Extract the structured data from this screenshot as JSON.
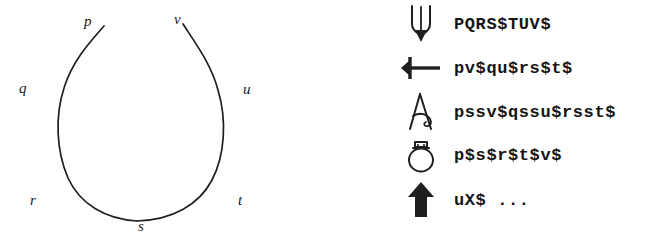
{
  "figure": {
    "caption": "",
    "ink_color": "#1a1a1a",
    "background_color": "#ffffff"
  },
  "loop_diagram": {
    "name": "open-loop-curve",
    "description": "Open teardrop / loop curve with a gap at the top, labelled around its perimeter",
    "labels": [
      {
        "id": "p",
        "text": "p",
        "position": "top-left-tip"
      },
      {
        "id": "v",
        "text": "v",
        "position": "top-right-tip"
      },
      {
        "id": "q",
        "text": "q",
        "position": "upper-left-outside"
      },
      {
        "id": "u",
        "text": "u",
        "position": "upper-right-outside"
      },
      {
        "id": "r",
        "text": "r",
        "position": "lower-left-outside"
      },
      {
        "id": "t",
        "text": "t",
        "position": "lower-right-outside"
      },
      {
        "id": "s",
        "text": "s",
        "position": "bottom-center-outside"
      }
    ]
  },
  "legend": {
    "rows": [
      {
        "icon": "tuning-fork-pointed-icon",
        "code": "PQRS$TUV$"
      },
      {
        "icon": "left-arrow-with-crossbar-icon",
        "code": "pv$qu$rs$t$"
      },
      {
        "icon": "letter-a-loop-icon",
        "code": "pssv$qssu$rsst$"
      },
      {
        "icon": "circle-with-box-top-icon",
        "code": "p$s$r$t$v$"
      },
      {
        "icon": "solid-up-arrow-icon",
        "code": "uX$ ..."
      }
    ]
  }
}
